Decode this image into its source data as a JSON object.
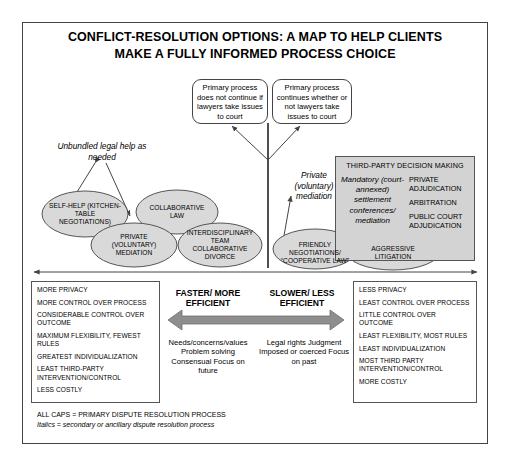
{
  "title": {
    "line1": "CONFLICT-RESOLUTION OPTIONS: A MAP TO HELP CLIENTS",
    "line2": "MAKE A FULLY INFORMED PROCESS CHOICE"
  },
  "callouts": {
    "left": "Primary process does not continue if lawyers take issues to court",
    "right": "Primary process continues whether or not lawyers take issues to court"
  },
  "secondary_labels": {
    "unbundled": "Unbundled legal help as needed",
    "private_mediation": "Private (voluntary) mediation"
  },
  "third_party_panel": {
    "title": "THIRD-PARTY DECISION MAKING",
    "italic_process": "Mandatory (court-annexed) settlement conferences/ mediation",
    "options": [
      "PRIVATE ADJUDICATION",
      "ARBITRATION",
      "PUBLIC COURT ADJUDICATION"
    ]
  },
  "processes": [
    {
      "id": "self-help",
      "label": "SELF-HELP (KITCHEN-TABLE NEGOTIATIONS)"
    },
    {
      "id": "collaborative-law",
      "label": "COLLABORATIVE LAW"
    },
    {
      "id": "private-voluntary-mediation",
      "label": "PRIVATE (VOLUNTARY) MEDIATION"
    },
    {
      "id": "interdisciplinary-team-collaborative-divorce",
      "label": "INTERDISCIPLINARY TEAM COLLABORATIVE DIVORCE"
    },
    {
      "id": "friendly-negotiations-cooperative-law",
      "label": "FRIENDLY NEGOTIATIONS/ “COOPERATIVE LAW”"
    },
    {
      "id": "aggressive-litigation",
      "label": "AGGRESSIVE LITIGATION"
    }
  ],
  "attributes_left": [
    "MORE PRIVACY",
    "MORE CONTROL OVER PROCESS",
    "CONSIDERABLE CONTROL OVER OUTCOME",
    "MAXIMUM FLEXIBILITY, FEWEST RULES",
    "GREATEST INDIVIDUALIZATION",
    "LEAST THIRD-PARTY INTERVENTION/CONTROL",
    "LESS COSTLY"
  ],
  "attributes_right": [
    "LESS PRIVACY",
    "LEAST CONTROL OVER PROCESS",
    "LITTLE CONTROL OVER OUTCOME",
    "LEAST FLEXIBILITY, MOST RULES",
    "LEAST INDIVIDUALIZATION",
    "MOST THIRD PARTY INTERVENTION/CONTROL",
    "MORE COSTLY"
  ],
  "middle": {
    "head_left": "FASTER/ MORE EFFICIENT",
    "head_right": "SLOWER/ LESS EFFICIENT",
    "list_left": "Needs/concerns/values Problem solving Consensual Focus on future",
    "list_right": "Legal rights Judgment Imposed or coerced Focus on past"
  },
  "legend": {
    "caps": "ALL CAPS = PRIMARY DISPUTE RESOLUTION PROCESS",
    "italics": "Italics = secondary or ancillary dispute resolution process"
  },
  "colors": {
    "ellipse_fill": "#d9d9d9",
    "panel_fill": "#d3d3d3",
    "stroke": "#444444",
    "arrow": "#555555",
    "text": "#000000"
  }
}
